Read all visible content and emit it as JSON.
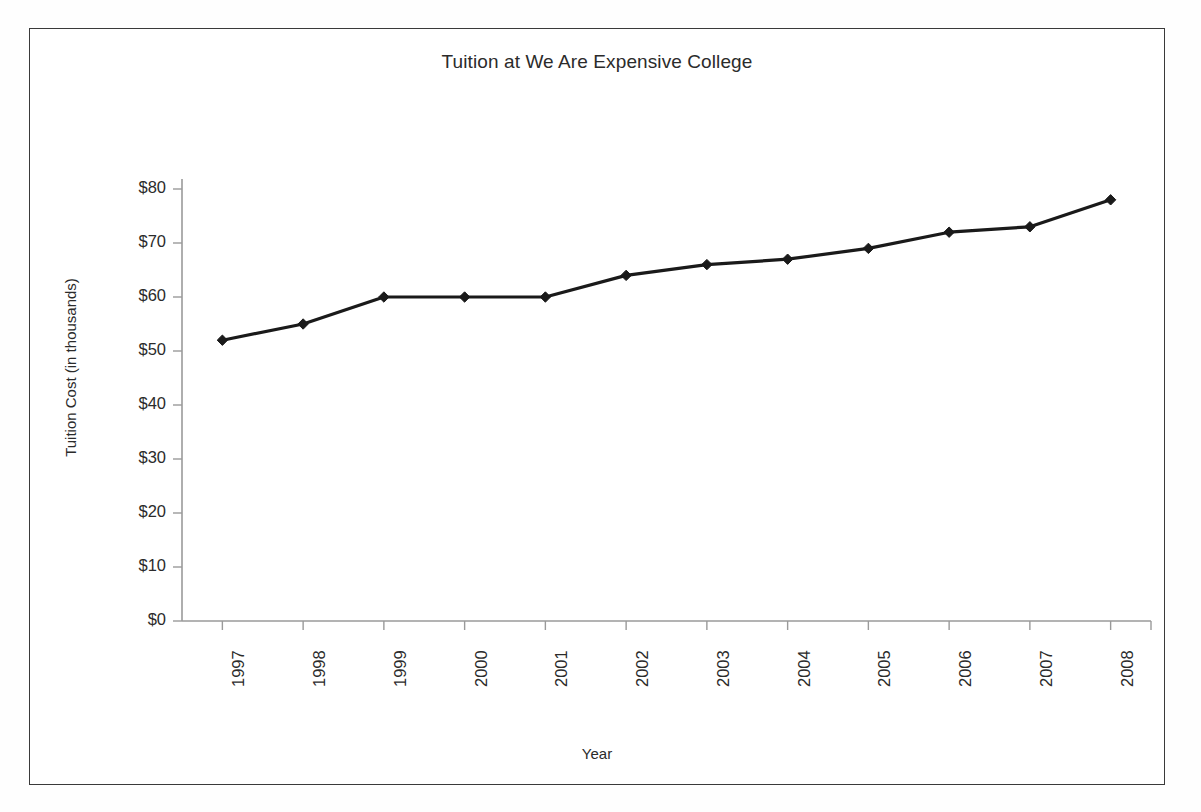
{
  "chart_data": {
    "type": "line",
    "title": "Tuition at We Are Expensive College",
    "xlabel": "Year",
    "ylabel": "Tuition Cost (in thousands)",
    "categories": [
      "1997",
      "1998",
      "1999",
      "2000",
      "2001",
      "2002",
      "2003",
      "2004",
      "2005",
      "2006",
      "2007",
      "2008"
    ],
    "values": [
      52,
      55,
      60,
      60,
      60,
      64,
      66,
      67,
      69,
      72,
      73,
      78
    ],
    "series": [
      {
        "name": "Tuition Cost",
        "values": [
          52,
          55,
          60,
          60,
          60,
          64,
          66,
          67,
          69,
          72,
          73,
          78
        ]
      }
    ],
    "ytick_labels": [
      "$80",
      "$70",
      "$60",
      "$50",
      "$40",
      "$30",
      "$20",
      "$10",
      "$0"
    ],
    "ytick_values": [
      80,
      70,
      60,
      50,
      40,
      30,
      20,
      10,
      0
    ],
    "ylim": [
      0,
      80
    ],
    "grid": false,
    "legend": false,
    "legend_position": "none",
    "marker": "diamond",
    "line_color": "#1a1a1a",
    "marker_color": "#1a1a1a",
    "axis_color": "#9a9a9a",
    "frame_color": "#3a3a3a",
    "background": "#ffffff",
    "xtick_rotation": -90
  }
}
